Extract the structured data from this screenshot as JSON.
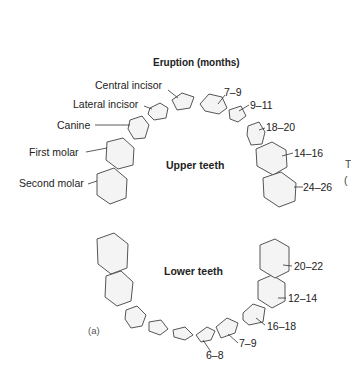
{
  "title": "Eruption (months)",
  "upper": {
    "heading": "Upper teeth",
    "tooth_names": [
      "Central incisor",
      "Lateral incisor",
      "Canine",
      "First molar",
      "Second molar"
    ],
    "eruption": [
      "7–9",
      "9–11",
      "18–20",
      "14–16",
      "24–26"
    ]
  },
  "lower": {
    "heading": "Lower teeth",
    "eruption": [
      "6–8",
      "7–9",
      "16–18",
      "12–14",
      "20–22"
    ]
  },
  "panel_label": "(a)",
  "edge_fragment": [
    "T",
    "("
  ]
}
